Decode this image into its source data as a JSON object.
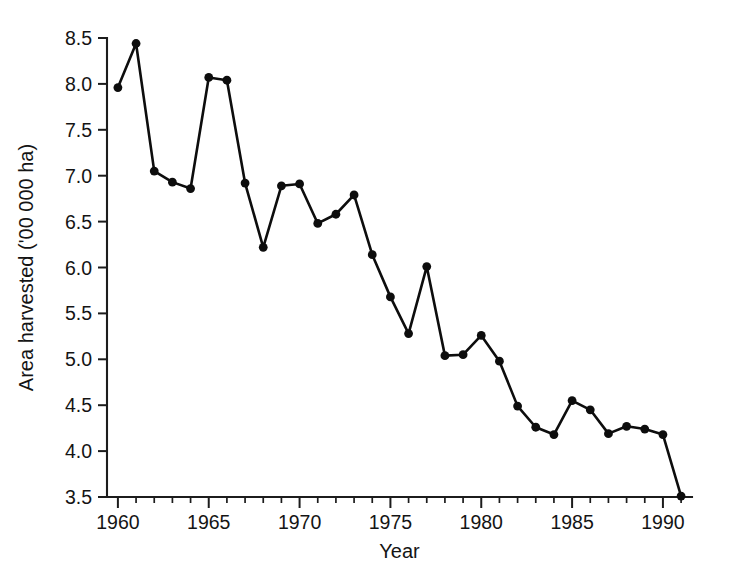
{
  "chart_data": {
    "type": "line",
    "title": "",
    "xlabel": "Year",
    "ylabel": "Area harvested ('00 000 ha)",
    "xlim": [
      1959.4,
      1991.6
    ],
    "ylim": [
      3.5,
      8.5
    ],
    "grid": false,
    "legend": null,
    "x": [
      1960,
      1961,
      1962,
      1963,
      1964,
      1965,
      1966,
      1967,
      1968,
      1969,
      1970,
      1971,
      1972,
      1973,
      1974,
      1975,
      1976,
      1977,
      1978,
      1979,
      1980,
      1981,
      1982,
      1983,
      1984,
      1985,
      1986,
      1987,
      1988,
      1989,
      1990,
      1991
    ],
    "values": [
      7.96,
      8.44,
      7.05,
      6.93,
      6.86,
      8.07,
      8.04,
      6.92,
      6.22,
      6.89,
      6.91,
      6.48,
      6.58,
      6.79,
      6.14,
      5.68,
      5.28,
      6.01,
      5.04,
      5.05,
      5.26,
      4.98,
      4.49,
      4.26,
      4.18,
      4.55,
      4.45,
      4.19,
      4.27,
      4.24,
      4.18,
      3.51
    ],
    "xticks_major": [
      1960,
      1965,
      1970,
      1975,
      1980,
      1985,
      1990
    ],
    "xticks_major_labels": [
      "1960",
      "1965",
      "1970",
      "1975",
      "1980",
      "1985",
      "1990"
    ],
    "xticks_minor": [
      1961,
      1962,
      1963,
      1964,
      1966,
      1967,
      1968,
      1969,
      1971,
      1972,
      1973,
      1974,
      1976,
      1977,
      1978,
      1979,
      1981,
      1982,
      1983,
      1984,
      1986,
      1987,
      1988,
      1989,
      1991
    ],
    "yticks": [
      3.5,
      4.0,
      4.5,
      5.0,
      5.5,
      6.0,
      6.5,
      7.0,
      7.5,
      8.0,
      8.5
    ],
    "ytick_labels": [
      "3.5",
      "4.0",
      "4.5",
      "5.0",
      "5.5",
      "6.0",
      "6.5",
      "7.0",
      "7.5",
      "8.0",
      "8.5"
    ],
    "series_color": "#0d0d0d",
    "marker": "circle",
    "marker_size": 4.4
  }
}
